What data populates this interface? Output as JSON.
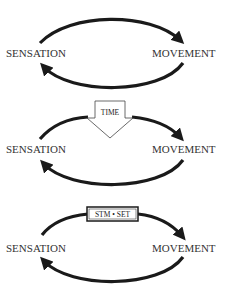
{
  "diagrams": [
    {
      "id": "basic-loop",
      "left_label": "SENSATION",
      "right_label": "MOVEMENT"
    },
    {
      "id": "time-loop",
      "left_label": "SENSATION",
      "right_label": "MOVEMENT",
      "insert_label": "TIME",
      "insert_shape": "block-arrow-down"
    },
    {
      "id": "stm-set-loop",
      "left_label": "SENSATION",
      "right_label": "MOVEMENT",
      "insert_label": "STM • SET",
      "insert_shape": "box"
    }
  ],
  "colors": {
    "arrow": "#1a1a1a",
    "text": "#333333",
    "background": "#ffffff"
  }
}
